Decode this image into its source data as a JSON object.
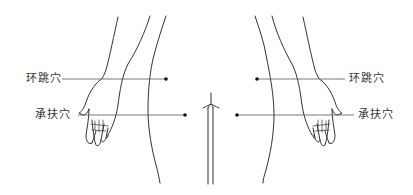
{
  "diagram": {
    "type": "anatomical-acupoint-illustration",
    "labels": {
      "left_upper": "环跳穴",
      "left_lower": "承扶穴",
      "right_upper": "环跳穴",
      "right_lower": "承扶穴"
    },
    "points": [
      {
        "name": "环跳穴",
        "side": "left",
        "x": 166,
        "y": 79
      },
      {
        "name": "承扶穴",
        "side": "left",
        "x": 185,
        "y": 115
      },
      {
        "name": "环跳穴",
        "side": "right",
        "x": 257,
        "y": 79
      },
      {
        "name": "承扶穴",
        "side": "right",
        "x": 237,
        "y": 115
      }
    ],
    "colors": {
      "line": "#333333",
      "point": "#111111",
      "background": "#ffffff"
    }
  }
}
